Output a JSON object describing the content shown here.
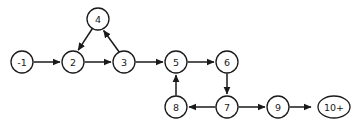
{
  "diagram": {
    "type": "directed-graph",
    "background_color": "#ffffff",
    "stroke_color": "#1a1a1a",
    "node_fill_color": "#ffffff",
    "nodes": [
      {
        "id": "n-1",
        "label": "-1",
        "shape": "circle",
        "cx": 22,
        "cy": 62,
        "r": 11
      },
      {
        "id": "n2",
        "label": "2",
        "shape": "circle",
        "cx": 73,
        "cy": 62,
        "r": 11
      },
      {
        "id": "n3",
        "label": "3",
        "shape": "circle",
        "cx": 124,
        "cy": 62,
        "r": 11
      },
      {
        "id": "n4",
        "label": "4",
        "shape": "circle",
        "cx": 98,
        "cy": 19,
        "r": 11
      },
      {
        "id": "n5",
        "label": "5",
        "shape": "circle",
        "cx": 176,
        "cy": 62,
        "r": 11
      },
      {
        "id": "n6",
        "label": "6",
        "shape": "circle",
        "cx": 227,
        "cy": 62,
        "r": 11
      },
      {
        "id": "n7",
        "label": "7",
        "shape": "circle",
        "cx": 227,
        "cy": 107,
        "r": 11
      },
      {
        "id": "n8",
        "label": "8",
        "shape": "circle",
        "cx": 176,
        "cy": 107,
        "r": 11
      },
      {
        "id": "n9",
        "label": "9",
        "shape": "circle",
        "cx": 278,
        "cy": 107,
        "r": 11
      },
      {
        "id": "n10p",
        "label": "10+",
        "shape": "ellipse",
        "cx": 334,
        "cy": 107,
        "rx": 16,
        "ry": 11
      }
    ],
    "edges": [
      {
        "id": "e-1-2",
        "from": "-1",
        "to": "2",
        "direction": "right"
      },
      {
        "id": "e2-3",
        "from": "2",
        "to": "3",
        "direction": "right"
      },
      {
        "id": "e3-4",
        "from": "3",
        "to": "4",
        "direction": "up-left"
      },
      {
        "id": "e4-2",
        "from": "4",
        "to": "2",
        "direction": "down-left"
      },
      {
        "id": "e3-5",
        "from": "3",
        "to": "5",
        "direction": "right"
      },
      {
        "id": "e5-6",
        "from": "5",
        "to": "6",
        "direction": "right"
      },
      {
        "id": "e6-7",
        "from": "6",
        "to": "7",
        "direction": "down"
      },
      {
        "id": "e7-8",
        "from": "7",
        "to": "8",
        "direction": "left"
      },
      {
        "id": "e8-5",
        "from": "8",
        "to": "5",
        "direction": "up"
      },
      {
        "id": "e7-9",
        "from": "7",
        "to": "9",
        "direction": "right"
      },
      {
        "id": "e9-10p",
        "from": "9",
        "to": "10+",
        "direction": "right"
      }
    ]
  }
}
